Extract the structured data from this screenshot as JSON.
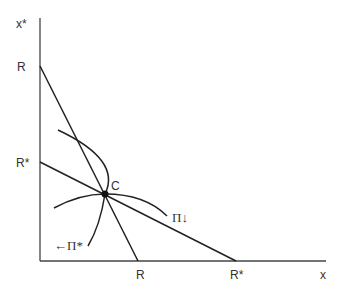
{
  "diagram": {
    "type": "economic-diagram",
    "axes": {
      "y_label": "x*",
      "x_label": "x"
    },
    "y_ticks": [
      {
        "label": "R"
      },
      {
        "label": "R*"
      }
    ],
    "x_ticks": [
      {
        "label": "R"
      },
      {
        "label": "R*"
      }
    ],
    "lines": [
      {
        "name": "R-R line",
        "from": "R on x* axis",
        "to": "R on x axis"
      },
      {
        "name": "R*-R* line",
        "from": "R* on x* axis",
        "to": "R* on x axis"
      }
    ],
    "curves": [
      {
        "name": "Pi-star",
        "label": "←Π*"
      },
      {
        "name": "Pi",
        "label": "Π↓"
      }
    ],
    "point": {
      "label": "C"
    },
    "colors": {
      "line": "#222222",
      "axis": "#444444",
      "text": "#333333",
      "background": "#ffffff"
    }
  }
}
